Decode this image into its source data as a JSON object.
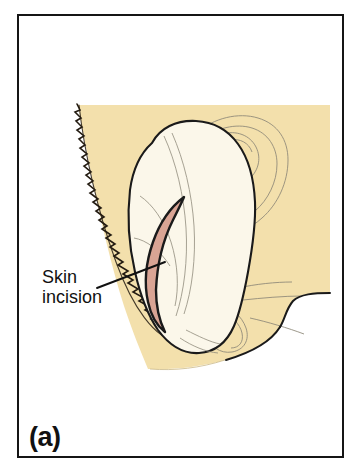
{
  "figure": {
    "caption": "(a)",
    "panel_border_color": "#151515",
    "background_color": "#ffffff"
  },
  "annotations": {
    "skin_incision": {
      "line1": "Skin",
      "line2": "incision",
      "text_color": "#111111",
      "leader_line_color": "#111111"
    }
  },
  "illustration": {
    "title": "Postauricular skin incision for ear surgery",
    "regions": [
      {
        "name": "scalp-skin-block",
        "label": "Skin / scalp background",
        "fill": "#F3E0AC"
      },
      {
        "name": "hairline",
        "label": "Hair-bearing scalp margin",
        "stroke": "#241c12"
      },
      {
        "name": "retracted-skin-flap",
        "label": "Postauricular skin flap",
        "fill": "#FBF7EA",
        "stroke": "#1a1a1a"
      },
      {
        "name": "incision-mark",
        "label": "Curved postauricular incision",
        "fill": "#D9A494",
        "stroke": "#1a1a1a"
      },
      {
        "name": "auricle-ghost-outline",
        "label": "Underlying auricle outline",
        "stroke": "#8d8878"
      },
      {
        "name": "neck-contour",
        "label": "Neck and jaw contour",
        "stroke": "#1a1a1a"
      }
    ],
    "colors": {
      "skin": "#F3E0AC",
      "flap": "#FBF7EA",
      "incision": "#D9A494",
      "outline": "#1a1a1a",
      "faint_line": "#8d8878"
    }
  }
}
